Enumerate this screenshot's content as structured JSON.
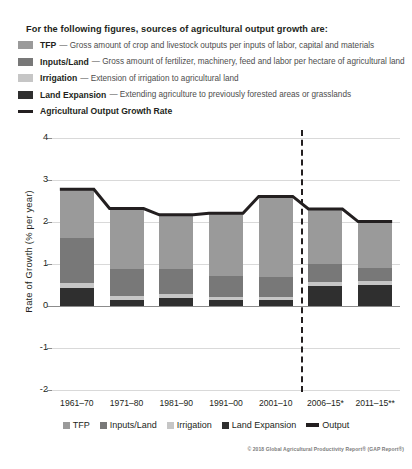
{
  "header": {
    "intro": "For the following figures, sources of agricultural output growth are:"
  },
  "legend": {
    "items": [
      {
        "term": "TFP",
        "dash": "—",
        "desc": "Gross amount of crop and livestock outputs per inputs of labor, capital and materials",
        "swatch": "tfp-swatch",
        "color": "#9a9a9a"
      },
      {
        "term": "Inputs/Land",
        "dash": "—",
        "desc": "Gross amount of fertilizer, machinery, feed and labor per hectare of agricultural land",
        "swatch": "inputs-land-swatch",
        "color": "#787878"
      },
      {
        "term": "Irrigation",
        "dash": "—",
        "desc": "Extension of irrigation to agricultural land",
        "swatch": "irrigation-swatch",
        "color": "#c6c6c6"
      },
      {
        "term": "Land Expansion",
        "dash": "—",
        "desc": "Extending agriculture to previously forested areas or grasslands",
        "swatch": "land-expansion-swatch",
        "color": "#2f2f2f"
      },
      {
        "term": "Agricultural Output Growth Rate",
        "dash": "",
        "desc": "",
        "swatch": "output-line-swatch",
        "color": "#231f20"
      }
    ]
  },
  "bottom_legend": {
    "items": [
      {
        "label": "TFP",
        "color": "#9a9a9a",
        "type": "swatch"
      },
      {
        "label": "Inputs/Land",
        "color": "#787878",
        "type": "swatch"
      },
      {
        "label": "Irrigation",
        "color": "#c6c6c6",
        "type": "swatch"
      },
      {
        "label": "Land Expansion",
        "color": "#2f2f2f",
        "type": "swatch"
      },
      {
        "label": "Output",
        "color": "#231f20",
        "type": "line"
      }
    ]
  },
  "copyright": "© 2018 Global Agricultural Productivity Report® (GAP Report®)",
  "chart_data": {
    "type": "bar",
    "stacked": true,
    "title": "",
    "xlabel": "",
    "ylabel": "Rate of Growth (% per year)",
    "ylim": [
      -2,
      4
    ],
    "yticks": [
      4,
      3,
      2,
      1,
      0,
      -1,
      -2
    ],
    "ytick_labels": [
      "4",
      "3",
      "2",
      "1",
      "0",
      "-1",
      "-2"
    ],
    "grid": true,
    "legend_position": "bottom",
    "categories": [
      "1961–70",
      "1971–80",
      "1981–90",
      "1991–00",
      "2001–10",
      "2006–15*",
      "2011–15**"
    ],
    "series": [
      {
        "name": "Land Expansion",
        "color": "#2f2f2f",
        "values": [
          0.44,
          0.14,
          0.2,
          0.14,
          0.14,
          0.47,
          0.5
        ]
      },
      {
        "name": "Irrigation",
        "color": "#c6c6c6",
        "values": [
          0.12,
          0.09,
          0.09,
          0.07,
          0.07,
          0.1,
          0.1
        ]
      },
      {
        "name": "Inputs/Land",
        "color": "#787878",
        "values": [
          1.05,
          0.64,
          0.6,
          0.5,
          0.47,
          0.43,
          0.31
        ]
      },
      {
        "name": "TFP",
        "color": "#9a9a9a",
        "values": [
          1.15,
          1.45,
          1.28,
          1.5,
          1.93,
          1.31,
          1.1
        ]
      }
    ],
    "line_series": {
      "name": "Output",
      "color": "#231f20",
      "values": [
        2.78,
        2.32,
        2.17,
        2.21,
        2.61,
        2.31,
        2.01
      ]
    },
    "annotations": [
      {
        "name": "projection-divider",
        "type": "vertical-dashed-line",
        "after_category": "2001–10"
      }
    ]
  }
}
